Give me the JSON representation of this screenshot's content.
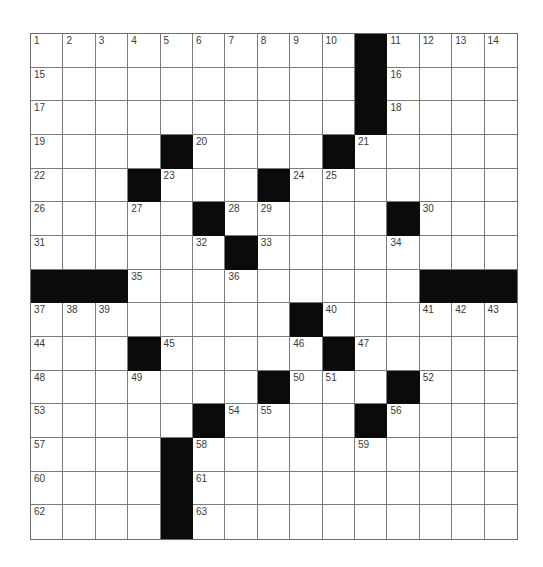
{
  "puzzle": {
    "rows": 15,
    "cols": 15,
    "colors": {
      "block": "#0b0b0b",
      "cell": "#ffffff",
      "grid_line": "#7a7a7a",
      "number": "#3a3a3a"
    },
    "grid": [
      "..........#....",
      "..........#....",
      "..........#....",
      "....#....#.....",
      "...#...#.......",
      ".....#.....#...",
      "......#........",
      "###.........###",
      "........#......",
      "...#.....#.....",
      ".......#...#...",
      ".....#....#....",
      "....#..........",
      "....#..........",
      "....#.........."
    ],
    "numbers": [
      {
        "r": 0,
        "c": 0,
        "n": "1"
      },
      {
        "r": 0,
        "c": 1,
        "n": "2"
      },
      {
        "r": 0,
        "c": 2,
        "n": "3"
      },
      {
        "r": 0,
        "c": 3,
        "n": "4"
      },
      {
        "r": 0,
        "c": 4,
        "n": "5"
      },
      {
        "r": 0,
        "c": 5,
        "n": "6"
      },
      {
        "r": 0,
        "c": 6,
        "n": "7"
      },
      {
        "r": 0,
        "c": 7,
        "n": "8"
      },
      {
        "r": 0,
        "c": 8,
        "n": "9"
      },
      {
        "r": 0,
        "c": 9,
        "n": "10"
      },
      {
        "r": 0,
        "c": 11,
        "n": "11"
      },
      {
        "r": 0,
        "c": 12,
        "n": "12"
      },
      {
        "r": 0,
        "c": 13,
        "n": "13"
      },
      {
        "r": 0,
        "c": 14,
        "n": "14"
      },
      {
        "r": 1,
        "c": 0,
        "n": "15"
      },
      {
        "r": 1,
        "c": 11,
        "n": "16"
      },
      {
        "r": 2,
        "c": 0,
        "n": "17"
      },
      {
        "r": 2,
        "c": 11,
        "n": "18"
      },
      {
        "r": 3,
        "c": 0,
        "n": "19"
      },
      {
        "r": 3,
        "c": 5,
        "n": "20"
      },
      {
        "r": 3,
        "c": 10,
        "n": "21"
      },
      {
        "r": 4,
        "c": 0,
        "n": "22"
      },
      {
        "r": 4,
        "c": 4,
        "n": "23"
      },
      {
        "r": 4,
        "c": 8,
        "n": "24"
      },
      {
        "r": 4,
        "c": 9,
        "n": "25"
      },
      {
        "r": 5,
        "c": 0,
        "n": "26"
      },
      {
        "r": 5,
        "c": 3,
        "n": "27"
      },
      {
        "r": 5,
        "c": 6,
        "n": "28"
      },
      {
        "r": 5,
        "c": 7,
        "n": "29"
      },
      {
        "r": 5,
        "c": 12,
        "n": "30"
      },
      {
        "r": 6,
        "c": 0,
        "n": "31"
      },
      {
        "r": 6,
        "c": 5,
        "n": "32"
      },
      {
        "r": 6,
        "c": 7,
        "n": "33"
      },
      {
        "r": 6,
        "c": 11,
        "n": "34"
      },
      {
        "r": 7,
        "c": 3,
        "n": "35"
      },
      {
        "r": 7,
        "c": 6,
        "n": "36"
      },
      {
        "r": 8,
        "c": 0,
        "n": "37"
      },
      {
        "r": 8,
        "c": 1,
        "n": "38"
      },
      {
        "r": 8,
        "c": 2,
        "n": "39"
      },
      {
        "r": 8,
        "c": 9,
        "n": "40"
      },
      {
        "r": 8,
        "c": 12,
        "n": "41"
      },
      {
        "r": 8,
        "c": 13,
        "n": "42"
      },
      {
        "r": 8,
        "c": 14,
        "n": "43"
      },
      {
        "r": 9,
        "c": 0,
        "n": "44"
      },
      {
        "r": 9,
        "c": 4,
        "n": "45"
      },
      {
        "r": 9,
        "c": 8,
        "n": "46"
      },
      {
        "r": 9,
        "c": 10,
        "n": "47"
      },
      {
        "r": 10,
        "c": 0,
        "n": "48"
      },
      {
        "r": 10,
        "c": 3,
        "n": "49"
      },
      {
        "r": 10,
        "c": 8,
        "n": "50"
      },
      {
        "r": 10,
        "c": 9,
        "n": "51"
      },
      {
        "r": 10,
        "c": 12,
        "n": "52"
      },
      {
        "r": 11,
        "c": 0,
        "n": "53"
      },
      {
        "r": 11,
        "c": 6,
        "n": "54"
      },
      {
        "r": 11,
        "c": 7,
        "n": "55"
      },
      {
        "r": 11,
        "c": 11,
        "n": "56"
      },
      {
        "r": 12,
        "c": 0,
        "n": "57"
      },
      {
        "r": 12,
        "c": 5,
        "n": "58"
      },
      {
        "r": 12,
        "c": 10,
        "n": "59"
      },
      {
        "r": 13,
        "c": 0,
        "n": "60"
      },
      {
        "r": 13,
        "c": 5,
        "n": "61"
      },
      {
        "r": 14,
        "c": 0,
        "n": "62"
      },
      {
        "r": 14,
        "c": 5,
        "n": "63"
      }
    ]
  }
}
